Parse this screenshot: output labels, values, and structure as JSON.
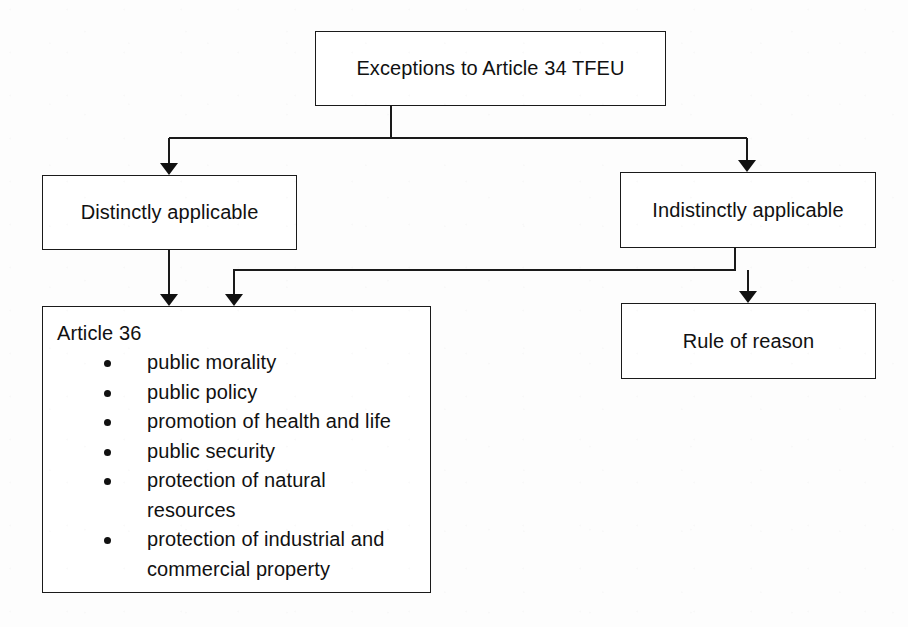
{
  "diagram": {
    "type": "flowchart",
    "title": "Exceptions to Article 34 TFEU",
    "background_color": "#fdfdfd",
    "line_color": "#1a1a1a",
    "text_color": "#111111",
    "nodes": {
      "root": {
        "label": "Exceptions to Article 34 TFEU"
      },
      "distinctly": {
        "label": "Distinctly applicable"
      },
      "indistinctly": {
        "label": "Indistinctly applicable"
      },
      "rule_of_reason": {
        "label": "Rule of reason"
      },
      "article36": {
        "title": "Article 36",
        "bullets": [
          "public morality",
          "public policy",
          "promotion of health and life",
          "public security",
          "protection of natural resources",
          "protection of industrial and commercial property"
        ]
      }
    },
    "edges": [
      {
        "from": "root",
        "to": "distinctly"
      },
      {
        "from": "root",
        "to": "indistinctly"
      },
      {
        "from": "distinctly",
        "to": "article36"
      },
      {
        "from": "indistinctly",
        "to": "article36"
      },
      {
        "from": "indistinctly",
        "to": "rule_of_reason"
      }
    ]
  }
}
